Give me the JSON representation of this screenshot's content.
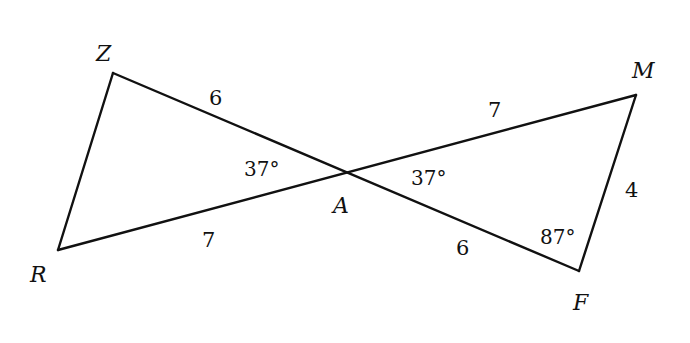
{
  "diagram": {
    "type": "two triangles sharing vertex A (vertical angles)",
    "vertices": {
      "Z": {
        "label": "Z",
        "x": 113,
        "y": 73
      },
      "R": {
        "label": "R",
        "x": 58,
        "y": 250
      },
      "A": {
        "label": "A",
        "x": 347,
        "y": 172
      },
      "M": {
        "label": "M",
        "x": 636,
        "y": 95
      },
      "F": {
        "label": "F",
        "x": 579,
        "y": 271
      }
    },
    "segments": [
      {
        "from": "Z",
        "to": "F",
        "note": "line through A"
      },
      {
        "from": "R",
        "to": "M",
        "note": "line through A"
      },
      {
        "from": "Z",
        "to": "R"
      },
      {
        "from": "M",
        "to": "F"
      }
    ],
    "side_labels": {
      "ZA": "6",
      "RA": "7",
      "AM": "7",
      "AF": "6",
      "MF": "4"
    },
    "angle_labels": {
      "ZAR": "37°",
      "MAF": "37°",
      "AFM": "87°"
    }
  }
}
